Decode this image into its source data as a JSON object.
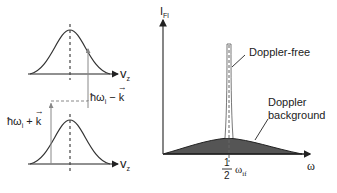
{
  "left_diagram": {
    "top_axis_label": "v",
    "top_axis_sub": "z",
    "bottom_axis_label": "v",
    "bottom_axis_sub": "z",
    "minus_label_prefix": "ħω",
    "minus_label_sub": "i",
    "minus_label_op": " − ",
    "minus_label_vec": "k",
    "plus_label_prefix": "ħω",
    "plus_label_sub": "i",
    "plus_label_op": " + ",
    "plus_label_vec": "k"
  },
  "right_diagram": {
    "y_axis_label": "I",
    "y_axis_sub": "Fl",
    "x_axis_label": "ω",
    "center_frac_num": "1",
    "center_frac_den": "2",
    "center_omega": "ω",
    "center_omega_sub": "if",
    "peak_label": "Doppler-free",
    "background_label_line1": "Doppler",
    "background_label_line2": "background"
  },
  "colors": {
    "line": "#333333",
    "shade": "#555555",
    "arrow_gray": "#888888"
  }
}
